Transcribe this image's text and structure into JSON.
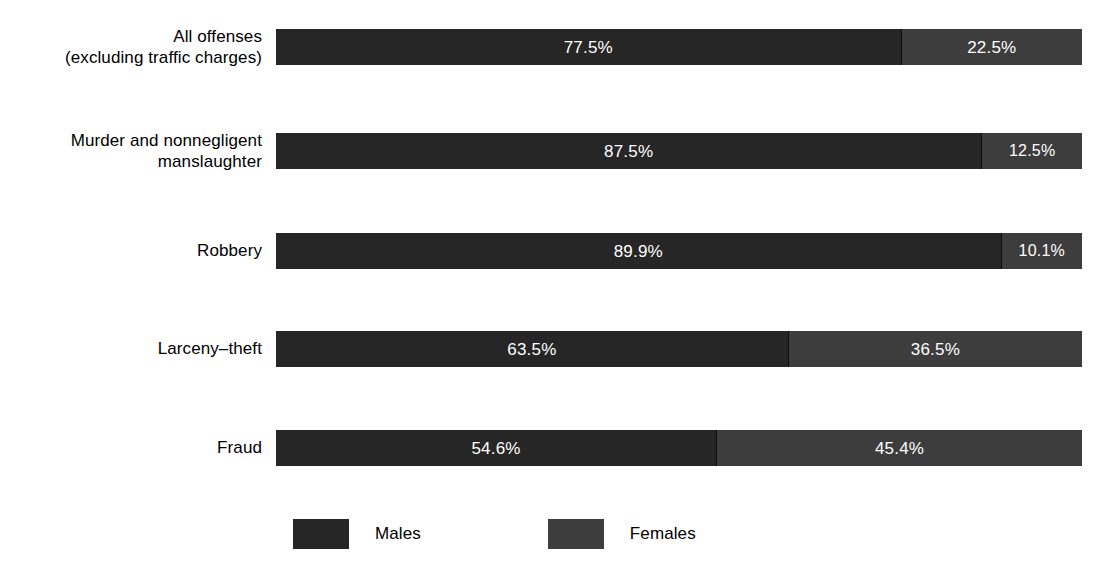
{
  "chart_data": {
    "type": "bar",
    "subtype": "stacked-horizontal-100pct",
    "title": "",
    "xlabel": "",
    "ylabel": "",
    "xlim": [
      0,
      100
    ],
    "grid": false,
    "legend_position": "bottom",
    "categories": [
      "All offenses\n(excluding traffic charges)",
      "Murder and nonnegligent\nmanslaughter",
      "Robbery",
      "Larceny–theft",
      "Fraud"
    ],
    "series": [
      {
        "name": "Males",
        "color": "#262626",
        "values": [
          77.5,
          87.5,
          89.9,
          63.5,
          54.6
        ],
        "labels": [
          "77.5%",
          "87.5%",
          "89.9%",
          "63.5%",
          "54.6%"
        ]
      },
      {
        "name": "Females",
        "color": "#3d3d3d",
        "values": [
          22.5,
          12.5,
          10.1,
          36.5,
          45.4
        ],
        "labels": [
          "22.5%",
          "12.5%",
          "10.1%",
          "36.5%",
          "45.4%"
        ]
      }
    ]
  },
  "rows": [
    {
      "label": "All offenses\n(excluding traffic charges)",
      "lines": 2,
      "male_pct": 77.5,
      "female_pct": 22.5,
      "male_label": "77.5%",
      "female_label": "22.5%"
    },
    {
      "label": "Murder and nonnegligent\nmanslaughter",
      "lines": 2,
      "male_pct": 87.5,
      "female_pct": 12.5,
      "male_label": "87.5%",
      "female_label": "12.5%"
    },
    {
      "label": "Robbery",
      "lines": 1,
      "male_pct": 89.9,
      "female_pct": 10.1,
      "male_label": "89.9%",
      "female_label": "10.1%"
    },
    {
      "label": "Larceny–theft",
      "lines": 1,
      "male_pct": 63.5,
      "female_pct": 36.5,
      "male_label": "63.5%",
      "female_label": "36.5%"
    },
    {
      "label": "Fraud",
      "lines": 1,
      "male_pct": 54.6,
      "female_pct": 45.4,
      "male_label": "54.6%",
      "female_label": "45.4%"
    }
  ],
  "legend": {
    "items": [
      {
        "label": "Males",
        "color": "#262626"
      },
      {
        "label": "Females",
        "color": "#3d3d3d"
      }
    ]
  },
  "colors": {
    "male": "#262626",
    "female": "#3d3d3d",
    "background": "#ffffff",
    "text": "#000000",
    "value_text": "#ffffff"
  },
  "layout": {
    "row_tops": [
      29,
      133,
      233,
      331,
      430
    ]
  }
}
